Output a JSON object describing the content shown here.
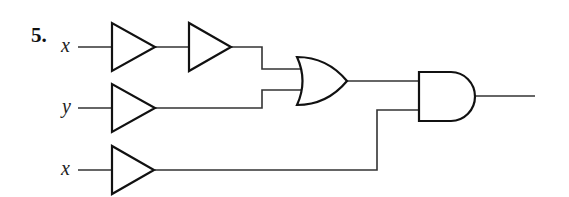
{
  "problem_number": "5.",
  "inputs": [
    {
      "id": "in1",
      "label": "x"
    },
    {
      "id": "in2",
      "label": "y"
    },
    {
      "id": "in3",
      "label": "x"
    }
  ],
  "gates": [
    {
      "id": "buf1",
      "type": "buffer"
    },
    {
      "id": "buf2",
      "type": "buffer"
    },
    {
      "id": "buf3",
      "type": "buffer"
    },
    {
      "id": "buf4",
      "type": "buffer"
    },
    {
      "id": "or1",
      "type": "or"
    },
    {
      "id": "and1",
      "type": "and"
    }
  ],
  "connections": [
    [
      "in1",
      "buf1"
    ],
    [
      "buf1",
      "buf2"
    ],
    [
      "buf2",
      "or1"
    ],
    [
      "in2",
      "buf3"
    ],
    [
      "buf3",
      "or1"
    ],
    [
      "in3",
      "buf4"
    ],
    [
      "or1",
      "and1"
    ],
    [
      "buf4",
      "and1"
    ],
    [
      "and1",
      "output"
    ]
  ]
}
